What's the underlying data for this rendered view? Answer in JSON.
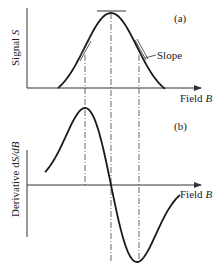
{
  "panel_a": {
    "tag": "(a)",
    "ylabel": "Signal",
    "ylabel_var": "S",
    "xlabel": "Field",
    "xlabel_var": "B",
    "slope_label": "Slope",
    "curve": "gaussian absorption signal"
  },
  "panel_b": {
    "tag": "(b)",
    "ylabel": "Derivative d",
    "ylabel_var": "S/dB",
    "xlabel": "Field",
    "xlabel_var": "B",
    "curve": "first derivative of signal"
  },
  "colors": {
    "line": "#1a1a1a",
    "axis": "#333333"
  }
}
